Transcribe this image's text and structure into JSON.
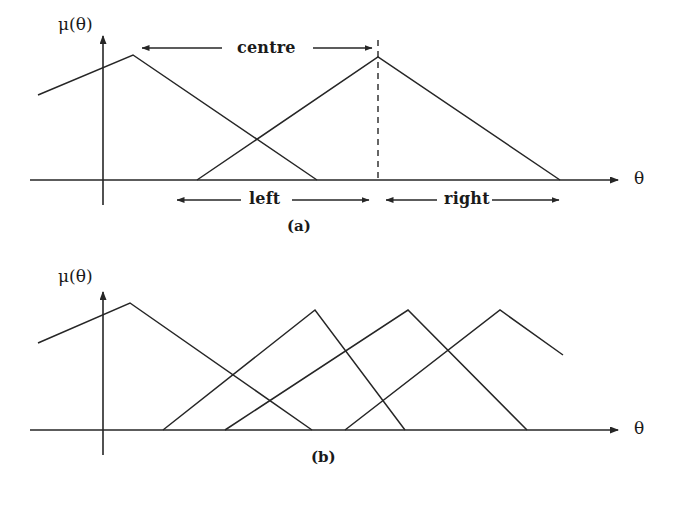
{
  "figure": {
    "background_color": "#ffffff",
    "line_color": "#262626",
    "text_color": "#1a1a1a"
  },
  "panel_a": {
    "caption": "(a)",
    "y_axis_label": "μ(θ)",
    "x_axis_label": "θ",
    "annotations": {
      "centre": "centre",
      "left": "left",
      "right": "right"
    }
  },
  "panel_b": {
    "caption": "(b)",
    "y_axis_label": "μ(θ)",
    "x_axis_label": "θ"
  },
  "chart_data": [
    {
      "type": "line",
      "title": "(a)",
      "xlabel": "θ",
      "ylabel": "μ(θ)",
      "grid": false,
      "legend": "none",
      "axis_origin": [
        103,
        180
      ],
      "baseline_y": 180,
      "x_axis_end": 622,
      "y_axis_top": 32,
      "series": [
        {
          "name": "membership-1",
          "points": [
            [
              38,
              95
            ],
            [
              133,
              55
            ],
            [
              317,
              180
            ]
          ],
          "clipped_left": true
        },
        {
          "name": "membership-2",
          "points": [
            [
              197,
              180
            ],
            [
              378,
              57
            ],
            [
              560,
              180
            ]
          ],
          "clipped_left": false
        }
      ],
      "markers": [
        {
          "name": "peak-2-dashed-guide",
          "type": "vertical-dashed",
          "x": 378,
          "y_top": 40,
          "y_bottom": 180
        }
      ],
      "annotations": [
        {
          "name": "centre",
          "label": "centre",
          "text_x": 243,
          "text_y": 40,
          "arrow_left": {
            "from_x": 222,
            "to_x": 140,
            "y": 48
          },
          "arrow_right": {
            "from_x": 313,
            "to_x": 374,
            "y": 48
          }
        },
        {
          "name": "left",
          "label": "left",
          "text_x": 253,
          "text_y": 191,
          "arrow_left": {
            "from_x": 241,
            "to_x": 175,
            "y": 200
          },
          "arrow_right": {
            "from_x": 293,
            "to_x": 371,
            "y": 200
          }
        },
        {
          "name": "right",
          "label": "right",
          "text_x": 448,
          "text_y": 191,
          "arrow_left": {
            "from_x": 437,
            "to_x": 384,
            "y": 200
          },
          "arrow_right": {
            "from_x": 492,
            "to_x": 561,
            "y": 200
          }
        }
      ]
    },
    {
      "type": "line",
      "title": "(b)",
      "xlabel": "θ",
      "ylabel": "μ(θ)",
      "grid": false,
      "legend": "none",
      "axis_origin": [
        103,
        430
      ],
      "baseline_y": 430,
      "x_axis_end": 622,
      "y_axis_top": 288,
      "series": [
        {
          "name": "membership-1",
          "points": [
            [
              38,
              343
            ],
            [
              130,
              303
            ],
            [
              312,
              430
            ]
          ],
          "clipped_left": true
        },
        {
          "name": "membership-2",
          "points": [
            [
              163,
              430
            ],
            [
              315,
              310
            ],
            [
              405,
              430
            ]
          ],
          "clipped_left": false
        },
        {
          "name": "membership-3",
          "points": [
            [
              225,
              430
            ],
            [
              408,
              310
            ],
            [
              527,
              430
            ]
          ],
          "clipped_left": false
        },
        {
          "name": "membership-4",
          "points": [
            [
              345,
              430
            ],
            [
              500,
              310
            ],
            [
              563,
              355
            ]
          ],
          "clipped_right": true
        }
      ],
      "annotations": []
    }
  ]
}
